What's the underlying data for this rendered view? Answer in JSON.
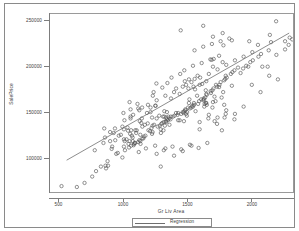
{
  "chart_data": {
    "type": "scatter",
    "title": "",
    "xlabel": "Gr Liv Area",
    "ylabel": "SalePrice",
    "xlim": [
      430,
      2330
    ],
    "ylim": [
      62000,
      258000
    ],
    "grid": false,
    "xticks": [
      500,
      1000,
      1500,
      2000
    ],
    "xtick_labels": [
      "500",
      "1000",
      "1500",
      "2000"
    ],
    "yticks": [
      100000,
      150000,
      200000,
      250000
    ],
    "ytick_labels": [
      "100000",
      "150000",
      "200000",
      "250000"
    ],
    "legend_position": "bottom-center",
    "series": [
      {
        "name": "Observations",
        "marker": "open-circle",
        "color": "#555555",
        "points": [
          [
            1710,
            208500
          ],
          [
            1262,
            181500
          ],
          [
            1786,
            223500
          ],
          [
            1717,
            140000
          ],
          [
            2198,
            250000
          ],
          [
            1362,
            143000
          ],
          [
            1694,
            207500
          ],
          [
            2090,
            200000
          ],
          [
            1774,
            129900
          ],
          [
            1077,
            118000
          ],
          [
            1040,
            129500
          ],
          [
            2324,
            230000
          ],
          [
            912,
            109500
          ],
          [
            1494,
            180000
          ],
          [
            1253,
            157000
          ],
          [
            854,
            132000
          ],
          [
            1004,
            149000
          ],
          [
            1296,
            90000
          ],
          [
            1114,
            159000
          ],
          [
            1339,
            139000
          ],
          [
            2376,
            235000
          ],
          [
            1108,
            129900
          ],
          [
            1795,
            144000
          ],
          [
            1060,
            143000
          ],
          [
            1060,
            153000
          ],
          [
            1600,
            180000
          ],
          [
            900,
            118000
          ],
          [
            1704,
            200000
          ],
          [
            1600,
            139000
          ],
          [
            520,
            68500
          ],
          [
            1317,
            129900
          ],
          [
            1228,
            144000
          ],
          [
            1234,
            168000
          ],
          [
            1700,
            155000
          ],
          [
            1561,
            186500
          ],
          [
            2452,
            240000
          ],
          [
            1097,
            130000
          ],
          [
            1297,
            127000
          ],
          [
            1057,
            126000
          ],
          [
            1152,
            134000
          ],
          [
            1324,
            145000
          ],
          [
            1328,
            135000
          ],
          [
            884,
            91000
          ],
          [
            938,
            132000
          ],
          [
            1150,
            155000
          ],
          [
            1752,
            177500
          ],
          [
            2149,
            235000
          ],
          [
            1656,
            158000
          ],
          [
            960,
            105000
          ],
          [
            1028,
            120000
          ],
          [
            1415,
            149000
          ],
          [
            1216,
            155000
          ],
          [
            1314,
            145000
          ],
          [
            1980,
            200000
          ],
          [
            1639,
            159000
          ],
          [
            1138,
            115000
          ],
          [
            1800,
            186500
          ],
          [
            1643,
            166000
          ],
          [
            2429,
            245000
          ],
          [
            1780,
            205000
          ],
          [
            1477,
            140000
          ],
          [
            1494,
            148000
          ],
          [
            1338,
            144000
          ],
          [
            1194,
            137500
          ],
          [
            1555,
            160000
          ],
          [
            1474,
            149000
          ],
          [
            1652,
            160000
          ],
          [
            1008,
            120000
          ],
          [
            2158,
            227000
          ],
          [
            1564,
            175000
          ],
          [
            1014,
            118000
          ],
          [
            1755,
            180000
          ],
          [
            1375,
            145000
          ],
          [
            1264,
            143000
          ],
          [
            1092,
            116000
          ],
          [
            1536,
            155000
          ],
          [
            1632,
            165000
          ],
          [
            1344,
            150000
          ],
          [
            1444,
            141000
          ],
          [
            864,
            91000
          ],
          [
            1516,
            160000
          ],
          [
            1356,
            145000
          ],
          [
            1224,
            132500
          ],
          [
            1728,
            180000
          ],
          [
            1432,
            149000
          ],
          [
            1502,
            150000
          ],
          [
            1649,
            160000
          ],
          [
            1136,
            125000
          ],
          [
            1232,
            135000
          ],
          [
            1652,
            170000
          ],
          [
            1232,
            128000
          ],
          [
            1804,
            190000
          ],
          [
            1856,
            194000
          ],
          [
            1044,
            115000
          ],
          [
            1070,
            124000
          ],
          [
            1634,
            164000
          ],
          [
            1344,
            142000
          ],
          [
            1490,
            152000
          ],
          [
            1456,
            148000
          ],
          [
            1200,
            130000
          ],
          [
            1844,
            192000
          ],
          [
            1686,
            173000
          ],
          [
            1428,
            147000
          ],
          [
            1320,
            139000
          ],
          [
            1008,
            112000
          ],
          [
            1996,
            205000
          ],
          [
            1628,
            163000
          ],
          [
            1488,
            153000
          ],
          [
            1244,
            136000
          ],
          [
            1152,
            121000
          ],
          [
            2080,
            214000
          ],
          [
            1764,
            183000
          ],
          [
            1542,
            157000
          ],
          [
            1372,
            142000
          ],
          [
            1128,
            119000
          ],
          [
            1940,
            198000
          ],
          [
            1708,
            176000
          ],
          [
            1510,
            155000
          ],
          [
            1300,
            137000
          ],
          [
            1096,
            116000
          ],
          [
            2268,
            228000
          ],
          [
            1872,
            196000
          ],
          [
            1596,
            162000
          ],
          [
            1392,
            145000
          ],
          [
            1164,
            123000
          ],
          [
            2140,
            218000
          ],
          [
            1812,
            188000
          ],
          [
            1556,
            158000
          ],
          [
            1336,
            140000
          ],
          [
            1120,
            117000
          ],
          [
            1920,
            193000
          ],
          [
            1688,
            171000
          ],
          [
            1468,
            150000
          ],
          [
            1272,
            134000
          ],
          [
            1064,
            113000
          ],
          [
            2016,
            207000
          ],
          [
            1736,
            178000
          ],
          [
            1524,
            154000
          ],
          [
            1308,
            138000
          ],
          [
            1088,
            115000
          ],
          [
            2304,
            232000
          ],
          [
            1900,
            199000
          ],
          [
            1612,
            164000
          ],
          [
            1404,
            146000
          ],
          [
            1176,
            124000
          ],
          [
            2060,
            211000
          ],
          [
            1792,
            185000
          ],
          [
            1548,
            156000
          ],
          [
            1352,
            141000
          ],
          [
            1136,
            118000
          ],
          [
            1964,
            201000
          ],
          [
            1700,
            174000
          ],
          [
            1480,
            151000
          ],
          [
            1288,
            135000
          ],
          [
            1048,
            111000
          ],
          [
            880,
            96000
          ],
          [
            948,
            104000
          ],
          [
            1016,
            108000
          ],
          [
            1084,
            113500
          ],
          [
            790,
            85000
          ],
          [
            828,
            90000
          ],
          [
            760,
            79000
          ],
          [
            700,
            72000
          ],
          [
            640,
            67500
          ],
          [
            868,
            88000
          ],
          [
            996,
            100000
          ],
          [
            1124,
            106000
          ],
          [
            1180,
            110000
          ],
          [
            1252,
            113000
          ],
          [
            1320,
            108000
          ],
          [
            1388,
            112000
          ],
          [
            1456,
            109000
          ],
          [
            1524,
            114000
          ],
          [
            1592,
            110500
          ],
          [
            1660,
            116000
          ],
          [
            1060,
            145000
          ],
          [
            1128,
            152000
          ],
          [
            1196,
            158000
          ],
          [
            1264,
            163000
          ],
          [
            1332,
            168000
          ],
          [
            1400,
            172000
          ],
          [
            1468,
            178000
          ],
          [
            1536,
            183000
          ],
          [
            1604,
            188000
          ],
          [
            1672,
            192000
          ],
          [
            1740,
            197000
          ],
          [
            1808,
            202000
          ],
          [
            1876,
            207000
          ],
          [
            1944,
            211000
          ],
          [
            2012,
            216000
          ],
          [
            1160,
            121000
          ],
          [
            1228,
            126000
          ],
          [
            1296,
            131000
          ],
          [
            1364,
            136000
          ],
          [
            1432,
            141000
          ],
          [
            1500,
            146000
          ],
          [
            1568,
            151000
          ],
          [
            1636,
            156000
          ],
          [
            1704,
            161000
          ],
          [
            1772,
            166000
          ],
          [
            1480,
            196000
          ],
          [
            1548,
            201000
          ],
          [
            1616,
            204000
          ],
          [
            1684,
            208000
          ],
          [
            1752,
            212000
          ],
          [
            1560,
            218000
          ],
          [
            1628,
            222000
          ],
          [
            1696,
            225000
          ],
          [
            1764,
            228000
          ],
          [
            1832,
            231000
          ],
          [
            1380,
            188000
          ],
          [
            1448,
            192000
          ],
          [
            1516,
            186000
          ],
          [
            1584,
            190000
          ],
          [
            1652,
            184000
          ],
          [
            900,
            128000
          ],
          [
            968,
            124000
          ],
          [
            1036,
            133000
          ],
          [
            1104,
            127000
          ],
          [
            1172,
            136000
          ],
          [
            940,
            119000
          ],
          [
            1008,
            131000
          ],
          [
            1076,
            122000
          ],
          [
            1144,
            138000
          ],
          [
            1212,
            129000
          ],
          [
            1240,
            172000
          ],
          [
            1308,
            177000
          ],
          [
            1376,
            165000
          ],
          [
            1444,
            170000
          ],
          [
            1512,
            176000
          ],
          [
            1580,
            168000
          ],
          [
            1648,
            174000
          ],
          [
            1716,
            167000
          ],
          [
            1784,
            172000
          ],
          [
            1852,
            179000
          ],
          [
            2132,
            200000
          ],
          [
            2200,
            213000
          ],
          [
            2268,
            219000
          ],
          [
            1988,
            228000
          ],
          [
            2056,
            224000
          ],
          [
            1452,
            240000
          ],
          [
            1628,
            245000
          ],
          [
            1704,
            233000
          ],
          [
            1852,
            229000
          ],
          [
            1780,
            237000
          ],
          [
            1052,
            161000
          ],
          [
            1120,
            154000
          ],
          [
            1188,
            149000
          ],
          [
            1256,
            157000
          ],
          [
            1324,
            151000
          ],
          [
            780,
            108000
          ],
          [
            848,
            116000
          ],
          [
            916,
            112000
          ],
          [
            984,
            125000
          ],
          [
            1052,
            118000
          ],
          [
            1600,
            131000
          ],
          [
            1668,
            143000
          ],
          [
            1736,
            137000
          ],
          [
            1804,
            148000
          ],
          [
            1872,
            142000
          ],
          [
            1264,
            104000
          ],
          [
            1332,
            110000
          ],
          [
            1400,
            102000
          ],
          [
            1468,
            107000
          ],
          [
            1536,
            113000
          ],
          [
            2008,
            180000
          ],
          [
            2076,
            172000
          ],
          [
            2144,
            190000
          ],
          [
            2212,
            186000
          ],
          [
            2296,
            224000
          ],
          [
            1944,
            156000
          ],
          [
            1876,
            148000
          ],
          [
            1808,
            152000
          ],
          [
            1740,
            144000
          ],
          [
            1672,
            147000
          ],
          [
            1012,
            141000
          ],
          [
            1080,
            147000
          ],
          [
            1148,
            143000
          ],
          [
            1216,
            150000
          ],
          [
            1284,
            146000
          ],
          [
            860,
            122000
          ],
          [
            928,
            127000
          ],
          [
            996,
            134000
          ],
          [
            1064,
            130000
          ],
          [
            1132,
            140000
          ],
          [
            1520,
            164000
          ],
          [
            1588,
            159000
          ],
          [
            1656,
            169000
          ],
          [
            1724,
            162000
          ],
          [
            1792,
            158000
          ],
          [
            1348,
            182000
          ],
          [
            1416,
            176000
          ],
          [
            1484,
            184000
          ],
          [
            1552,
            178000
          ],
          [
            1620,
            181000
          ]
        ]
      }
    ],
    "fit_line": {
      "label": "Regression",
      "color": "#6e6e6e",
      "x_start": 560,
      "y_start": 97000,
      "x_end": 2300,
      "y_end": 237000
    },
    "legend": [
      {
        "label": "Regression",
        "type": "line",
        "color": "#6e6e6e"
      }
    ]
  }
}
